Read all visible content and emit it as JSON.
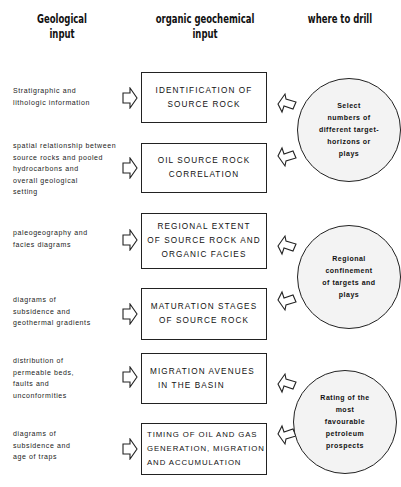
{
  "headers": {
    "geological": [
      "Geological",
      "input"
    ],
    "organic": [
      "organic geochemical",
      "input"
    ],
    "drill": [
      "where to drill"
    ]
  },
  "geological_inputs": [
    {
      "lines": [
        "Stratigraphic and",
        "lithologic information"
      ]
    },
    {
      "lines": [
        "spatial relationship between",
        "source rocks and pooled",
        "hydrocarbons and",
        "overall geological",
        "setting"
      ]
    },
    {
      "lines": [
        "paleogeography and",
        "facies diagrams"
      ]
    },
    {
      "lines": [
        "diagrams of",
        "subsidence and",
        "geothermal gradients"
      ]
    },
    {
      "lines": [
        "distribution of",
        "permeable beds,",
        "faults and",
        "unconformities"
      ]
    },
    {
      "lines": [
        "diagrams of",
        "subsidence and",
        "age of traps"
      ]
    }
  ],
  "geochemical_boxes": [
    {
      "lines": [
        "IDENTIFICATION  OF",
        "SOURCE  ROCK"
      ]
    },
    {
      "lines": [
        "OIL  SOURCE  ROCK",
        "CORRELATION"
      ]
    },
    {
      "lines": [
        "REGIONAL  EXTENT",
        "OF  SOURCE  ROCK  AND",
        "ORGANIC  FACIES"
      ]
    },
    {
      "lines": [
        "MATURATION  STAGES",
        "OF  SOURCE  ROCK"
      ]
    },
    {
      "lines": [
        "MIGRATION  AVENUES",
        "IN  THE  BASIN"
      ]
    },
    {
      "lines": [
        "TIMING  OF  OIL  AND  GAS",
        "GENERATION, MIGRATION",
        "AND  ACCUMULATION"
      ]
    }
  ],
  "drill_outcomes": [
    {
      "lines": [
        "Select",
        "numbers  of",
        "different  target-",
        "horizons  or",
        "plays"
      ]
    },
    {
      "lines": [
        "Regional",
        "confinement",
        "of  targets  and",
        "plays"
      ]
    },
    {
      "lines": [
        "Rating  of  the",
        "most",
        "favourable",
        "petroleum",
        "prospects"
      ]
    }
  ],
  "colors": {
    "line": "#222222",
    "circle_fill": "#f3f3f3",
    "background": "#ffffff"
  }
}
